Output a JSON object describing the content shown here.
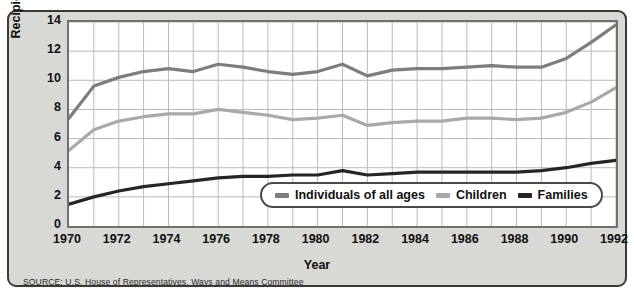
{
  "chart_data": {
    "type": "line",
    "title": "",
    "xlabel": "Year",
    "ylabel": "Recipients (in millions)",
    "xlim": [
      1970,
      1992
    ],
    "ylim": [
      0,
      14
    ],
    "ytick_step": 2,
    "xtick_step": 2,
    "grid": true,
    "legend_position": "inside-bottom-center",
    "x": [
      1970,
      1971,
      1972,
      1973,
      1974,
      1975,
      1976,
      1977,
      1978,
      1979,
      1980,
      1981,
      1982,
      1983,
      1984,
      1985,
      1986,
      1987,
      1988,
      1989,
      1990,
      1991,
      1992
    ],
    "xticks": [
      "1970",
      "1972",
      "1974",
      "1976",
      "1978",
      "1980",
      "1982",
      "1984",
      "1986",
      "1988",
      "1990",
      "1992"
    ],
    "yticks": [
      "0",
      "2",
      "4",
      "6",
      "8",
      "10",
      "12",
      "14"
    ],
    "series": [
      {
        "name": "Individuals of all ages",
        "color": "#7d7d7d",
        "values": [
          7.4,
          9.6,
          10.2,
          10.6,
          10.8,
          10.6,
          11.1,
          10.9,
          10.6,
          10.4,
          10.6,
          11.1,
          10.3,
          10.7,
          10.8,
          10.8,
          10.9,
          11.0,
          10.9,
          10.9,
          11.5,
          12.6,
          13.8
        ]
      },
      {
        "name": "Children",
        "color": "#a9a9a9",
        "values": [
          5.2,
          6.6,
          7.2,
          7.5,
          7.7,
          7.7,
          8.0,
          7.8,
          7.6,
          7.3,
          7.4,
          7.6,
          6.9,
          7.1,
          7.2,
          7.2,
          7.4,
          7.4,
          7.3,
          7.4,
          7.8,
          8.5,
          9.5
        ]
      },
      {
        "name": "Families",
        "color": "#252525",
        "values": [
          1.5,
          2.0,
          2.4,
          2.7,
          2.9,
          3.1,
          3.3,
          3.4,
          3.4,
          3.5,
          3.5,
          3.8,
          3.5,
          3.6,
          3.7,
          3.7,
          3.7,
          3.7,
          3.7,
          3.8,
          4.0,
          4.3,
          4.5
        ]
      }
    ],
    "source": "SOURCE: U.S. House of Representatives, Ways and Means Committee"
  },
  "legend": {
    "items": [
      {
        "label": "Individuals of all ages"
      },
      {
        "label": "Children"
      },
      {
        "label": "Families"
      }
    ]
  }
}
